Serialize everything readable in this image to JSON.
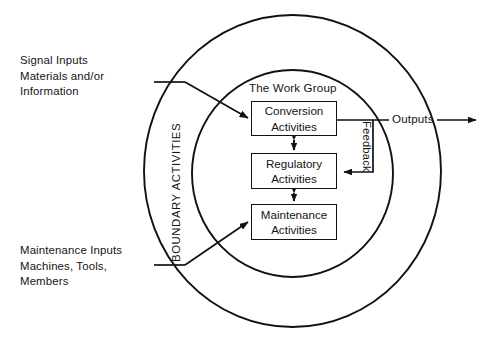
{
  "diagram": {
    "title_inner": "The Work Group",
    "ring_label": "BOUNDARY ACTIVITIES",
    "outputs_label": "Outputs",
    "feedback_label": "Feedback",
    "inputs": {
      "signal": {
        "line1": "Signal Inputs",
        "line2": "Materials and/or",
        "line3": "Information",
        "full": "Signal Inputs\nMaterials and/or\nInformation"
      },
      "maintenance": {
        "line1": "Maintenance Inputs",
        "line2": "Machines, Tools,",
        "line3": "Members",
        "full": "Maintenance Inputs\nMachines, Tools,\nMembers"
      }
    },
    "nodes": [
      {
        "id": "conversion",
        "line1": "Conversion",
        "line2": "Activities"
      },
      {
        "id": "regulatory",
        "line1": "Regulatory",
        "line2": "Activities"
      },
      {
        "id": "maintenance",
        "line1": "Maintenance",
        "line2": "Activities"
      }
    ],
    "colors": {
      "stroke": "#111111",
      "text": "#141414",
      "background": "#ffffff"
    },
    "geometry": {
      "outer_ellipse": {
        "cx": 292.5,
        "cy": 171,
        "rx": 148.5,
        "ry": 156
      },
      "inner_ellipse": {
        "cx": 292.5,
        "cy": 173.5,
        "rx": 100.5,
        "ry": 103.5
      }
    }
  }
}
